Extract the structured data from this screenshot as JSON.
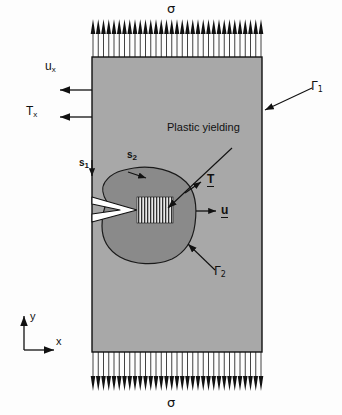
{
  "figure": {
    "title_absent": true,
    "colors": {
      "plate_fill": "#a8a8a8",
      "plastic_zone_fill": "#8a8a8a",
      "crack_fill": "#ffffff",
      "line": "#111111",
      "background": "#fdfdfd"
    }
  },
  "loads": {
    "top_stress_label": "σ",
    "bottom_stress_label": "σ",
    "top_arrow_count": 33,
    "bottom_arrow_count": 33,
    "top_arrow_direction": "up",
    "bottom_arrow_direction": "down"
  },
  "left_boundary": {
    "displacement_label": "u",
    "displacement_subscript": "x",
    "traction_label": "T",
    "traction_subscript": "x",
    "arrow_direction": "left"
  },
  "boundaries": {
    "gamma1_label": "Γ",
    "gamma1_subscript": "1",
    "gamma2_label": "Γ",
    "gamma2_subscript": "2",
    "s1_label": "s",
    "s1_subscript": "1",
    "s2_label": "s",
    "s2_subscript": "2"
  },
  "annotations": {
    "plastic_yielding": "Plastic yielding",
    "traction_vector": "T",
    "displacement_vector": "u"
  },
  "axes": {
    "x_label": "x",
    "y_label": "y"
  }
}
